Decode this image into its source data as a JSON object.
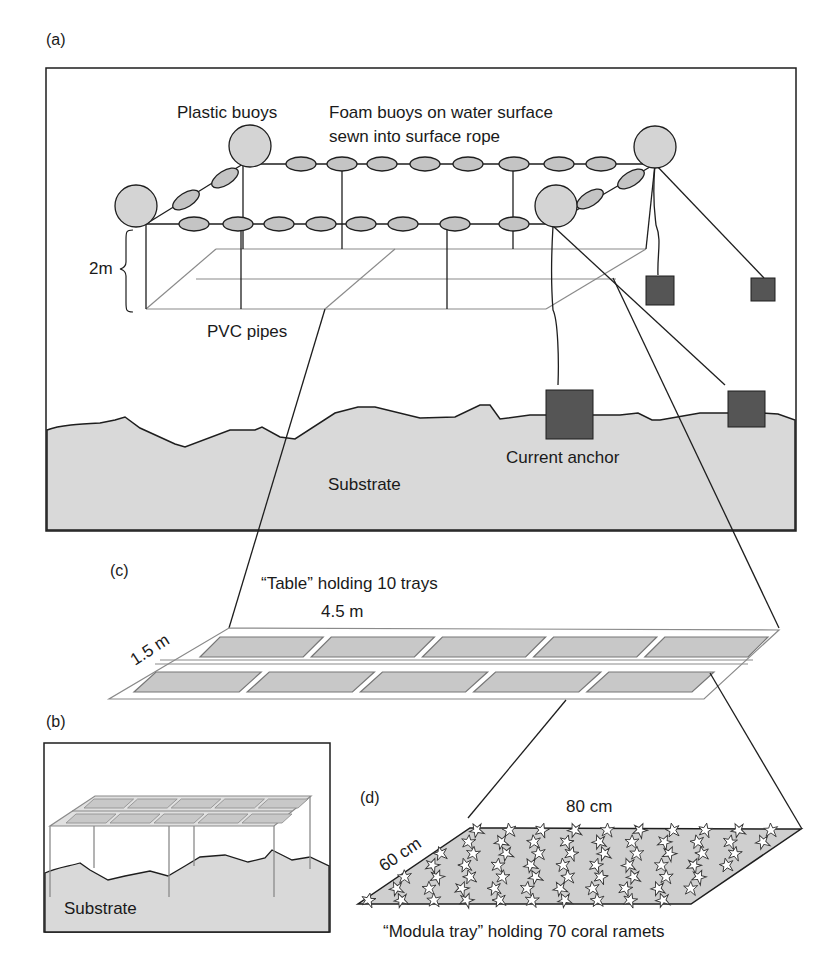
{
  "colors": {
    "substrate": "#d9d9d9",
    "buoy": "#d4d4d4",
    "foam": "#c4c4c4",
    "anchor": "#555555",
    "tray": "#c8c8c8",
    "line": "#1e1e1e",
    "pipe": "#8a8a8a"
  },
  "panels": {
    "a": {
      "tag": "(a)",
      "plastic_buoys": "Plastic buoys",
      "foam_line1": "Foam buoys on water surface",
      "foam_line2": "sewn into surface rope",
      "depth": "2m",
      "pvc": "PVC pipes",
      "anchor": "Current anchor",
      "substrate": "Substrate"
    },
    "b": {
      "tag": "(b)",
      "substrate": "Substrate"
    },
    "c": {
      "tag": "(c)",
      "title": "“Table” holding 10 trays",
      "length": "4.5 m",
      "width": "1.5 m",
      "tray_count": 10
    },
    "d": {
      "tag": "(d)",
      "length": "80 cm",
      "width": "60 cm",
      "caption": "“Modula tray” holding 70 coral ramets",
      "ramet_count": 70
    }
  }
}
